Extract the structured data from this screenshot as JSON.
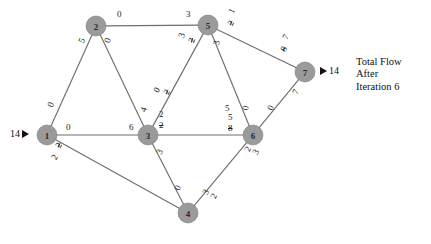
{
  "diagram": {
    "title_caption": [
      "Total Flow",
      "After",
      "Iteration 6"
    ],
    "node_fill": "#9a9a9a",
    "edge_color": "#6e6e6e",
    "nodes": [
      {
        "id": "1",
        "label": "1",
        "x": 47,
        "y": 135
      },
      {
        "id": "2",
        "label": "2",
        "x": 96,
        "y": 26
      },
      {
        "id": "3",
        "label": "3",
        "x": 148,
        "y": 135
      },
      {
        "id": "4",
        "label": "4",
        "x": 188,
        "y": 213
      },
      {
        "id": "5",
        "label": "5",
        "x": 208,
        "y": 25
      },
      {
        "id": "6",
        "label": "6",
        "x": 253,
        "y": 135
      },
      {
        "id": "7",
        "label": "7",
        "x": 305,
        "y": 72
      }
    ],
    "edges": [
      {
        "from": "1",
        "to": "2"
      },
      {
        "from": "1",
        "to": "3"
      },
      {
        "from": "1",
        "to": "4"
      },
      {
        "from": "2",
        "to": "5"
      },
      {
        "from": "2",
        "to": "3"
      },
      {
        "from": "3",
        "to": "5"
      },
      {
        "from": "3",
        "to": "4"
      },
      {
        "from": "3",
        "to": "6"
      },
      {
        "from": "4",
        "to": "6"
      },
      {
        "from": "5",
        "to": "6"
      },
      {
        "from": "5",
        "to": "7"
      },
      {
        "from": "6",
        "to": "7"
      }
    ],
    "edge_labels": [
      {
        "name": "label-1-2-near1",
        "text": "0",
        "x": 46,
        "y": 105,
        "rot": -66,
        "struck": false
      },
      {
        "name": "label-1-2-near2",
        "text": "5",
        "x": 77,
        "y": 41,
        "rot": -66,
        "struck": false
      },
      {
        "name": "label-1-3-near1",
        "text": "0",
        "x": 66,
        "y": 123,
        "rot": 0,
        "struck": false
      },
      {
        "name": "label-1-3-near3",
        "text": "6",
        "x": 129,
        "y": 123,
        "rot": 0,
        "struck": false
      },
      {
        "name": "label-1-4-struck",
        "text": "2",
        "x": 54,
        "y": 145,
        "rot": -60,
        "struck": true
      },
      {
        "name": "label-1-4-new",
        "text": "2",
        "x": 50,
        "y": 157,
        "rot": -60,
        "struck": false
      },
      {
        "name": "label-2-5-near2",
        "text": "0",
        "x": 117,
        "y": 10,
        "rot": 0,
        "struck": false
      },
      {
        "name": "label-2-5-near5",
        "text": "3",
        "x": 186,
        "y": 10,
        "rot": 0,
        "struck": false
      },
      {
        "name": "label-2-3-near2",
        "text": "0",
        "x": 103,
        "y": 41,
        "rot": -70,
        "struck": false
      },
      {
        "name": "label-2-3-near3",
        "text": "4",
        "x": 139,
        "y": 110,
        "rot": -70,
        "struck": false
      },
      {
        "name": "label-3-5-s1",
        "text": "3",
        "x": 177,
        "y": 36,
        "rot": -72,
        "struck": false
      },
      {
        "name": "label-3-5-s2",
        "text": "2",
        "x": 187,
        "y": 41,
        "rot": -72,
        "struck": true
      },
      {
        "name": "label-3-5-n1",
        "text": "2",
        "x": 159,
        "y": 110,
        "rot": 0,
        "struck": false
      },
      {
        "name": "label-3-5-n2",
        "text": "2",
        "x": 159,
        "y": 121,
        "rot": 0,
        "struck": true
      },
      {
        "name": "label-3-4-a",
        "text": "0",
        "x": 152,
        "y": 90,
        "rot": -62,
        "struck": false
      },
      {
        "name": "label-3-4-b",
        "text": "2",
        "x": 162,
        "y": 92,
        "rot": -62,
        "struck": true
      },
      {
        "name": "label-3-4-near3",
        "text": "3",
        "x": 155,
        "y": 152,
        "rot": -65,
        "struck": false
      },
      {
        "name": "label-3-4-near4",
        "text": "0",
        "x": 173,
        "y": 188,
        "rot": -65,
        "struck": false
      },
      {
        "name": "label-3-6-near6a",
        "text": "5",
        "x": 228,
        "y": 113,
        "rot": 0,
        "struck": false
      },
      {
        "name": "label-3-6-near6b",
        "text": "8",
        "x": 228,
        "y": 124,
        "rot": 0,
        "struck": true
      },
      {
        "name": "label-4-6-near4a",
        "text": "3",
        "x": 201,
        "y": 192,
        "rot": -62,
        "struck": false
      },
      {
        "name": "label-4-6-near4b",
        "text": "2",
        "x": 209,
        "y": 196,
        "rot": -62,
        "struck": false
      },
      {
        "name": "label-4-6-near6a",
        "text": "2",
        "x": 243,
        "y": 149,
        "rot": -62,
        "struck": false
      },
      {
        "name": "label-4-6-near6b",
        "text": "3",
        "x": 251,
        "y": 152,
        "rot": -62,
        "struck": false
      },
      {
        "name": "label-5-6-near5",
        "text": "3",
        "x": 212,
        "y": 44,
        "rot": -76,
        "struck": false
      },
      {
        "name": "label-5-6-near6",
        "text": "0",
        "x": 241,
        "y": 109,
        "rot": -76,
        "struck": false
      },
      {
        "name": "label-5-6-mid",
        "text": "5",
        "x": 225,
        "y": 104,
        "rot": 0,
        "struck": false
      },
      {
        "name": "label-5-7-near5a",
        "text": "1",
        "x": 227,
        "y": 11,
        "rot": -62,
        "struck": false
      },
      {
        "name": "label-5-7-near5b",
        "text": "2",
        "x": 226,
        "y": 23,
        "rot": -62,
        "struck": true
      },
      {
        "name": "label-5-7-near7a",
        "text": "7",
        "x": 281,
        "y": 37,
        "rot": -62,
        "struck": false
      },
      {
        "name": "label-5-7-near7b",
        "text": "8",
        "x": 279,
        "y": 49,
        "rot": -62,
        "struck": true
      },
      {
        "name": "label-6-7-near7",
        "text": "7",
        "x": 291,
        "y": 92,
        "rot": -64,
        "struck": false
      },
      {
        "name": "label-6-7-near6",
        "text": "0",
        "x": 266,
        "y": 108,
        "rot": -64,
        "struck": false
      }
    ],
    "terminals": [
      {
        "name": "source-flow",
        "value": "14",
        "x": 10,
        "y": 128,
        "arrow_side": "right"
      },
      {
        "name": "sink-flow",
        "value": "14",
        "x": 320,
        "y": 65,
        "arrow_side": "left"
      }
    ]
  }
}
